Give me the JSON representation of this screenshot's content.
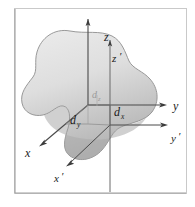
{
  "figure": {
    "background_color": "#ffffff",
    "frame_color": "#bfbfbf",
    "body_fill_top": "#e4e4e4",
    "body_fill_bottom": "#b9b9b9",
    "body_outline_color": "#8a8a8a",
    "axis_color": "#3c3c3c",
    "axis_color_light": "#8d8d8d",
    "label_color": "#1a1a1a",
    "faint_label_color": "#9a9a9a"
  },
  "axes": {
    "unprimed": {
      "z": {
        "label": "z",
        "x": 118,
        "y": 37
      },
      "y": {
        "label": "y",
        "x": 175,
        "y": 105
      },
      "x": {
        "label": "x",
        "x": 29,
        "y": 152
      }
    },
    "primed": {
      "z_prime": {
        "label": "z",
        "prime": "′",
        "x": 113,
        "y": 58
      },
      "y_prime": {
        "label": "y",
        "prime": "′",
        "x": 175,
        "y": 137
      },
      "x_prime": {
        "label": "x",
        "prime": "′",
        "x": 60,
        "y": 178
      }
    }
  },
  "dimensions": [
    {
      "name": "d_z",
      "base": "d",
      "subscript": "z",
      "x": 95,
      "y": 99,
      "faint": true
    },
    {
      "name": "d_y",
      "base": "d",
      "subscript": "y",
      "x": 76,
      "y": 123,
      "faint": false
    },
    {
      "name": "d_x",
      "base": "d",
      "subscript": "x",
      "x": 118,
      "y": 112,
      "faint": false
    }
  ],
  "origins": {
    "unprimed_origin": {
      "x": 88,
      "y": 105
    },
    "primed_origin": {
      "x": 110,
      "y": 118
    }
  }
}
